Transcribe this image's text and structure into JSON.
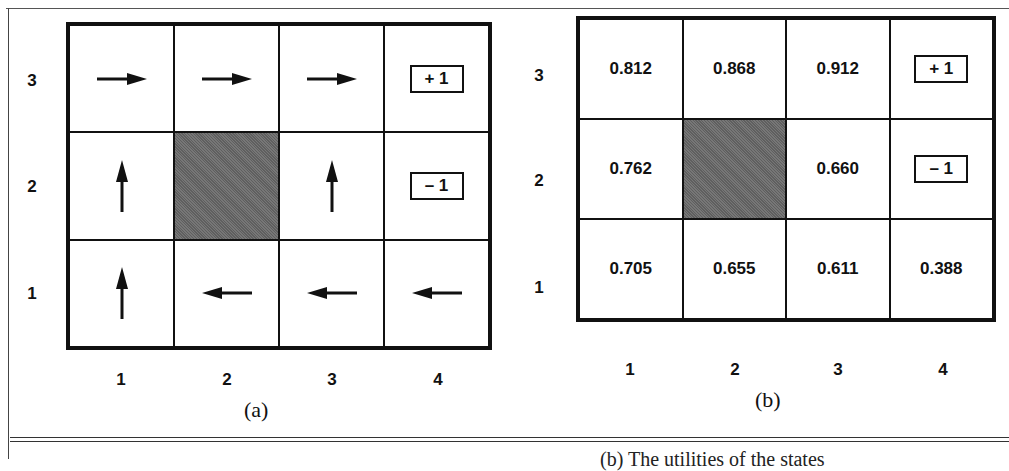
{
  "figure": {
    "panel_a": {
      "caption": "(a)",
      "row_labels": [
        "3",
        "2",
        "1"
      ],
      "col_labels": [
        "1",
        "2",
        "3",
        "4"
      ],
      "cells": [
        [
          {
            "type": "arrow",
            "dir": "right"
          },
          {
            "type": "arrow",
            "dir": "right"
          },
          {
            "type": "arrow",
            "dir": "right"
          },
          {
            "type": "terminal",
            "label": "+ 1"
          }
        ],
        [
          {
            "type": "arrow",
            "dir": "up"
          },
          {
            "type": "wall"
          },
          {
            "type": "arrow",
            "dir": "up"
          },
          {
            "type": "terminal",
            "label": "– 1"
          }
        ],
        [
          {
            "type": "arrow",
            "dir": "up"
          },
          {
            "type": "arrow",
            "dir": "left"
          },
          {
            "type": "arrow",
            "dir": "left"
          },
          {
            "type": "arrow",
            "dir": "left"
          }
        ]
      ]
    },
    "panel_b": {
      "caption": "(b)",
      "row_labels": [
        "3",
        "2",
        "1"
      ],
      "col_labels": [
        "1",
        "2",
        "3",
        "4"
      ],
      "cells": [
        [
          {
            "type": "value",
            "label": "0.812"
          },
          {
            "type": "value",
            "label": "0.868"
          },
          {
            "type": "value",
            "label": "0.912"
          },
          {
            "type": "terminal",
            "label": "+ 1"
          }
        ],
        [
          {
            "type": "value",
            "label": "0.762"
          },
          {
            "type": "wall"
          },
          {
            "type": "value",
            "label": "0.660"
          },
          {
            "type": "terminal",
            "label": "– 1"
          }
        ],
        [
          {
            "type": "value",
            "label": "0.705"
          },
          {
            "type": "value",
            "label": "0.655"
          },
          {
            "type": "value",
            "label": "0.611"
          },
          {
            "type": "value",
            "label": "0.388"
          }
        ]
      ]
    },
    "bottom_text_fragment": "(b) The utilities of the states"
  },
  "colors": {
    "wall": "#6b6b6b",
    "line": "#111111"
  }
}
